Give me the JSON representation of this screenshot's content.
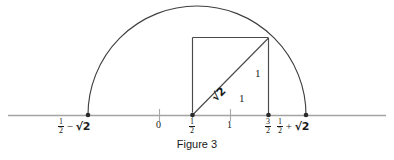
{
  "figure": {
    "caption": "Figure 3",
    "background_color": "#ffffff",
    "stroke_color": "#3c3c3c",
    "axis_color": "#9a9a9a",
    "text_color": "#1a1a1a"
  },
  "axis": {
    "name": "number-line",
    "y_px": 115,
    "x_start_px": 8,
    "x_end_px": 386,
    "unit_px": 77,
    "origin_x_px": 159
  },
  "ticks": [
    {
      "label_html": "0",
      "value": 0,
      "x_px": 159,
      "kind": "tick",
      "label_x_px": 156,
      "label_y_px": 120
    },
    {
      "label_html": "1/2",
      "value": 0.5,
      "x_px": 192,
      "kind": "dot",
      "label_x_px": 188,
      "label_y_px": 119
    },
    {
      "label_html": "1",
      "value": 1,
      "x_px": 230,
      "kind": "tick",
      "label_x_px": 227,
      "label_y_px": 120
    },
    {
      "label_html": "3/2",
      "value": 1.5,
      "x_px": 268,
      "kind": "dot",
      "label_x_px": 264,
      "label_y_px": 119
    }
  ],
  "endpoints": [
    {
      "name": "left-endpoint",
      "x_px": 88,
      "text": "1/2 - sqrt(2)",
      "num": "1",
      "den": "2",
      "operator": "−",
      "radical": "√2",
      "label_x_px": 60,
      "label_y_px": 119
    },
    {
      "name": "right-endpoint",
      "x_px": 306,
      "text": "1/2 + sqrt(2)",
      "num": "1",
      "den": "2",
      "operator": "+",
      "radical": "√2",
      "label_x_px": 278,
      "label_y_px": 119
    }
  ],
  "semicircle": {
    "center_x_px": 197,
    "center_y_px": 115,
    "radius_px": 109,
    "apex_y_px": 8,
    "value_radius": "sqrt(2)"
  },
  "rectangle": {
    "left_px": 192,
    "right_px": 268,
    "top_px": 37,
    "bottom_px": 115
  },
  "hypotenuse": {
    "x1_px": 192,
    "y1_px": 115,
    "x2_px": 268,
    "y2_px": 38,
    "label": "√2",
    "rotation_deg": -45,
    "label_x_px": 212,
    "label_y_px": 93
  },
  "side_labels": [
    {
      "name": "vertical-side-label",
      "text": "1",
      "x_px": 255,
      "y_px": 73
    },
    {
      "name": "horizontal-side-label",
      "text": "1",
      "x_px": 240,
      "y_px": 98
    }
  ]
}
